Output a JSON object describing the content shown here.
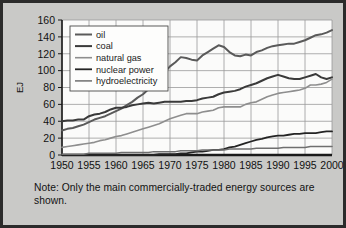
{
  "figure": {
    "background_color": "#c9c9c7",
    "border_color": "#2b2b2b",
    "plot_background_color": "#fbfbfa",
    "grid_color": "#9a9a9a"
  },
  "note": {
    "text": "Note: Only the main commercially-traded energy sources are shown."
  },
  "chart_data": {
    "type": "line",
    "title": "",
    "subtitle": "",
    "xlabel": "",
    "ylabel": "EJ",
    "xlim": [
      1950,
      2000
    ],
    "ylim": [
      0,
      160
    ],
    "grid": true,
    "legend_position": "top-left",
    "xticks": [
      1950,
      1955,
      1960,
      1965,
      1970,
      1975,
      1980,
      1985,
      1990,
      1995,
      2000
    ],
    "yticks": [
      0,
      20,
      40,
      60,
      80,
      100,
      120,
      140,
      160
    ],
    "x": [
      1950,
      1951,
      1952,
      1953,
      1954,
      1955,
      1956,
      1957,
      1958,
      1959,
      1960,
      1961,
      1962,
      1963,
      1964,
      1965,
      1966,
      1967,
      1968,
      1969,
      1970,
      1971,
      1972,
      1973,
      1974,
      1975,
      1976,
      1977,
      1978,
      1979,
      1980,
      1981,
      1982,
      1983,
      1984,
      1985,
      1986,
      1987,
      1988,
      1989,
      1990,
      1991,
      1992,
      1993,
      1994,
      1995,
      1996,
      1997,
      1998,
      1999,
      2000
    ],
    "series": [
      {
        "name": "oil",
        "color": "#5a5a5a",
        "width": 2.0,
        "values": [
          29,
          31,
          32,
          34,
          36,
          39,
          42,
          44,
          46,
          49,
          52,
          55,
          59,
          63,
          68,
          72,
          78,
          83,
          90,
          98,
          105,
          110,
          116,
          115,
          113,
          112,
          118,
          122,
          126,
          130,
          128,
          122,
          118,
          117,
          119,
          118,
          122,
          124,
          127,
          129,
          130,
          131,
          132,
          132,
          134,
          136,
          139,
          142,
          143,
          145,
          148
        ]
      },
      {
        "name": "coal",
        "color": "#3a3a3a",
        "width": 2.0,
        "values": [
          40,
          41,
          41,
          42,
          42,
          46,
          48,
          49,
          51,
          54,
          56,
          56,
          57,
          59,
          60,
          61,
          62,
          61,
          62,
          63,
          63,
          63,
          63,
          64,
          64,
          65,
          67,
          68,
          69,
          72,
          74,
          75,
          76,
          78,
          81,
          83,
          85,
          88,
          91,
          93,
          95,
          93,
          91,
          90,
          90,
          92,
          94,
          96,
          92,
          90,
          92
        ]
      },
      {
        "name": "natural gas",
        "color": "#8e8e8e",
        "width": 1.6,
        "values": [
          9,
          10,
          11,
          12,
          13,
          14,
          15,
          17,
          18,
          20,
          22,
          23,
          25,
          27,
          29,
          31,
          33,
          35,
          37,
          40,
          43,
          45,
          47,
          49,
          49,
          49,
          51,
          52,
          53,
          56,
          57,
          57,
          57,
          57,
          60,
          62,
          63,
          66,
          69,
          71,
          73,
          74,
          75,
          76,
          77,
          79,
          83,
          83,
          84,
          86,
          90
        ]
      },
      {
        "name": "nuclear power",
        "color": "#242424",
        "width": 1.8,
        "values": [
          0,
          0,
          0,
          0,
          0,
          0,
          0,
          0,
          0,
          0,
          0,
          0,
          0,
          0,
          0,
          0,
          0,
          0,
          1,
          1,
          1,
          1,
          2,
          2,
          3,
          4,
          4,
          5,
          6,
          6,
          7,
          9,
          10,
          12,
          14,
          16,
          18,
          19,
          21,
          22,
          23,
          23,
          24,
          25,
          25,
          26,
          26,
          26,
          27,
          28,
          28
        ]
      },
      {
        "name": "hydroelectricity",
        "color": "#6f6f6f",
        "width": 1.5,
        "values": [
          1,
          1,
          1,
          1,
          1,
          2,
          2,
          2,
          2,
          2,
          2,
          3,
          3,
          3,
          3,
          3,
          3,
          4,
          4,
          4,
          4,
          4,
          5,
          5,
          5,
          5,
          6,
          6,
          6,
          6,
          6,
          7,
          7,
          7,
          7,
          7,
          8,
          8,
          8,
          8,
          8,
          9,
          9,
          9,
          9,
          9,
          10,
          10,
          10,
          10,
          10
        ]
      }
    ]
  }
}
